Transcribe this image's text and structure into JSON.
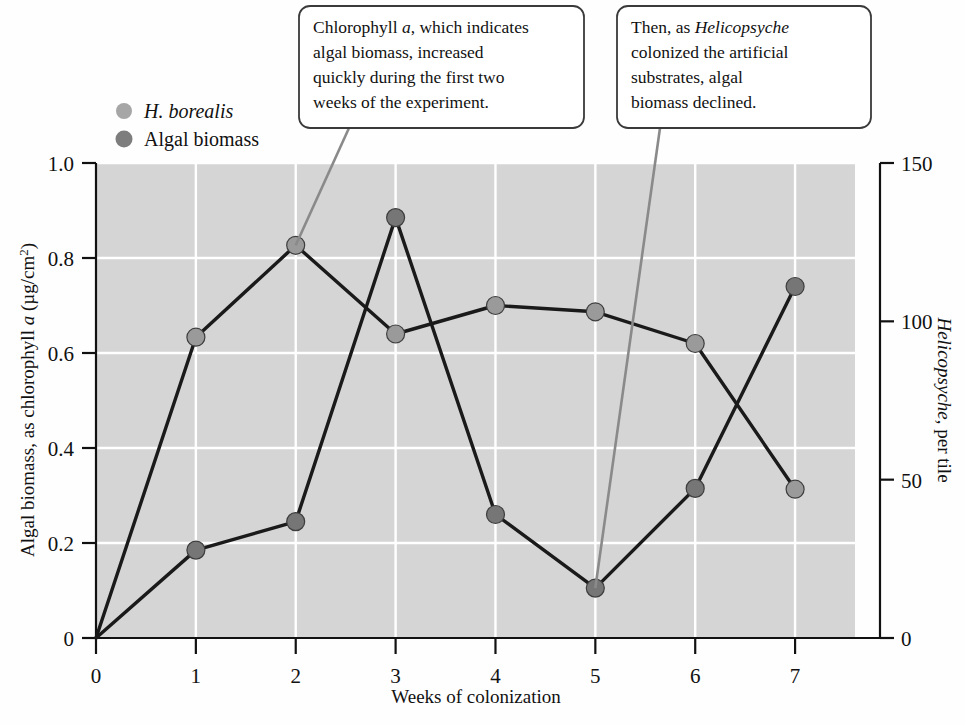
{
  "chart_data": {
    "type": "line",
    "title": "",
    "xlabel": "Weeks of colonization",
    "ylabel": "Algal biomass, as chlorophyll a (μg/cm²)",
    "ylabel_right": "Helicopsyche, per tile",
    "x": [
      0,
      1,
      2,
      3,
      4,
      5,
      6,
      7
    ],
    "xlim": [
      0,
      7.6
    ],
    "xticks": [
      "0",
      "1",
      "2",
      "3",
      "4",
      "5",
      "6",
      "7"
    ],
    "ylim": [
      0,
      1.0
    ],
    "yticks": [
      "0",
      "0.2",
      "0.4",
      "0.6",
      "0.8",
      "1.0"
    ],
    "ylim_right": [
      0,
      150
    ],
    "yticks_right": [
      "0",
      "50",
      "100",
      "150"
    ],
    "grid": true,
    "legend_position": "above-left",
    "series": [
      {
        "name": "H. borealis",
        "axis": "right",
        "color": "#8f8f8f",
        "values": [
          0,
          95,
          124,
          96,
          105,
          103,
          93,
          47
        ]
      },
      {
        "name": "Algal biomass",
        "axis": "left",
        "color": "#6e6e6e",
        "values": [
          0,
          0.185,
          0.245,
          0.885,
          0.26,
          0.105,
          0.315,
          0.74
        ]
      }
    ],
    "annotations": [
      {
        "id": "callout-increase",
        "lines": [
          "Chlorophyll a, which indicates",
          "algal biomass, increased",
          "quickly during the first two",
          "weeks of the experiment."
        ],
        "target_series": "H. borealis",
        "target_x": 2
      },
      {
        "id": "callout-decline",
        "lines": [
          "Then, as Helicopsyche",
          "colonized the artificial",
          "substrates, algal",
          "biomass declined."
        ],
        "target_series": "Algal biomass",
        "target_x": 5
      }
    ]
  },
  "legend": {
    "items": [
      {
        "label": "H. borealis",
        "marker_color": "#a6a6a6"
      },
      {
        "label": "Algal biomass",
        "marker_color": "#7d7d7d"
      }
    ]
  },
  "colors": {
    "plot_background": "#d5d5d5",
    "gridline": "#ffffff",
    "line": "#1a1a1a",
    "marker_light": "#9a9a9a",
    "marker_dark": "#767676",
    "leader_line": "#8a8a8a",
    "callout_border": "#3a3a3a",
    "axis": "#111111"
  }
}
